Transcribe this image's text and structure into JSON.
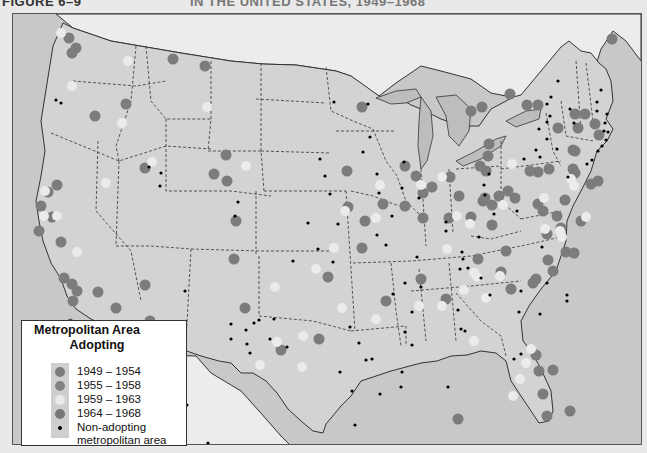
{
  "header": {
    "figure_label": "FIGURE 6–9",
    "title": "IN THE UNITED STATES, 1949–1968"
  },
  "colors": {
    "land": "#d3d3d3",
    "water": "#c6c6c6",
    "foreign": "#ececec",
    "dot_1949_1954": "#7c7c7c",
    "dot_1955_1958": "#828282",
    "dot_1959_1963": "#ebebeb",
    "dot_1964_1968": "#767676",
    "non_adopting": "#000000"
  },
  "legend": {
    "title_line1": "Metropolitan Area",
    "title_line2": "Adopting",
    "items": [
      {
        "label": "1949  –  1954",
        "type": "1949_1954"
      },
      {
        "label": "1955  –  1958",
        "type": "1955_1958"
      },
      {
        "label": "1959  –  1963",
        "type": "1959_1963"
      },
      {
        "label": "1964  –  1968",
        "type": "1964_1968"
      },
      {
        "label": "Non-adopting",
        "label2": "metropolitan area",
        "type": "non"
      }
    ]
  },
  "cities_adopting": [
    [
      68,
      37
    ],
    [
      75,
      47
    ],
    [
      71,
      52
    ],
    [
      172,
      58
    ],
    [
      204,
      65
    ],
    [
      94,
      115
    ],
    [
      125,
      103
    ],
    [
      144,
      167
    ],
    [
      225,
      154
    ],
    [
      213,
      173
    ],
    [
      226,
      180
    ],
    [
      56,
      184
    ],
    [
      47,
      191
    ],
    [
      40,
      205
    ],
    [
      51,
      216
    ],
    [
      38,
      230
    ],
    [
      60,
      241
    ],
    [
      63,
      277
    ],
    [
      71,
      283
    ],
    [
      76,
      290
    ],
    [
      72,
      300
    ],
    [
      115,
      307
    ],
    [
      97,
      291
    ],
    [
      144,
      284
    ],
    [
      149,
      320
    ],
    [
      160,
      333
    ],
    [
      235,
      220
    ],
    [
      233,
      258
    ],
    [
      244,
      307
    ],
    [
      280,
      349
    ],
    [
      318,
      338
    ],
    [
      327,
      276
    ],
    [
      361,
      247
    ],
    [
      347,
      206
    ],
    [
      364,
      220
    ],
    [
      382,
      203
    ],
    [
      385,
      300
    ],
    [
      420,
      278
    ],
    [
      445,
      298
    ],
    [
      457,
      418
    ],
    [
      361,
      106
    ],
    [
      346,
      170
    ],
    [
      404,
      165
    ],
    [
      415,
      175
    ],
    [
      422,
      192
    ],
    [
      404,
      205
    ],
    [
      422,
      217
    ],
    [
      458,
      195
    ],
    [
      485,
      170
    ],
    [
      487,
      155
    ],
    [
      479,
      165
    ],
    [
      449,
      176
    ],
    [
      431,
      186
    ],
    [
      448,
      217
    ],
    [
      470,
      216
    ],
    [
      482,
      200
    ],
    [
      491,
      204
    ],
    [
      498,
      195
    ],
    [
      507,
      190
    ],
    [
      514,
      197
    ],
    [
      484,
      197
    ],
    [
      537,
      203
    ],
    [
      537,
      171
    ],
    [
      529,
      170
    ],
    [
      548,
      168
    ],
    [
      572,
      149
    ],
    [
      572,
      168
    ],
    [
      564,
      199
    ],
    [
      556,
      215
    ],
    [
      470,
      110
    ],
    [
      488,
      143
    ],
    [
      481,
      106
    ],
    [
      509,
      93
    ],
    [
      526,
      104
    ],
    [
      537,
      104
    ],
    [
      557,
      127
    ],
    [
      574,
      113
    ],
    [
      584,
      113
    ],
    [
      574,
      150
    ],
    [
      577,
      127
    ],
    [
      594,
      123
    ],
    [
      598,
      134
    ],
    [
      574,
      172
    ],
    [
      590,
      183
    ],
    [
      597,
      180
    ],
    [
      580,
      220
    ],
    [
      560,
      227
    ],
    [
      542,
      210
    ],
    [
      546,
      233
    ],
    [
      491,
      224
    ],
    [
      477,
      258
    ],
    [
      565,
      251
    ],
    [
      573,
      252
    ],
    [
      547,
      259
    ],
    [
      500,
      271
    ],
    [
      552,
      270
    ],
    [
      535,
      278
    ],
    [
      532,
      282
    ],
    [
      510,
      288
    ],
    [
      535,
      354
    ],
    [
      538,
      370
    ],
    [
      552,
      369
    ],
    [
      542,
      393
    ],
    [
      569,
      410
    ],
    [
      546,
      415
    ],
    [
      505,
      250
    ],
    [
      611,
      38
    ]
  ],
  "cities_light": [
    [
      60,
      32
    ],
    [
      127,
      60
    ],
    [
      206,
      106
    ],
    [
      71,
      85
    ],
    [
      44,
      190
    ],
    [
      43,
      215
    ],
    [
      56,
      215
    ],
    [
      76,
      251
    ],
    [
      105,
      182
    ],
    [
      121,
      122
    ],
    [
      151,
      161
    ],
    [
      245,
      165
    ],
    [
      333,
      247
    ],
    [
      315,
      268
    ],
    [
      379,
      184
    ],
    [
      375,
      217
    ],
    [
      344,
      210
    ],
    [
      420,
      184
    ],
    [
      441,
      176
    ],
    [
      456,
      215
    ],
    [
      469,
      223
    ],
    [
      502,
      204
    ],
    [
      511,
      163
    ],
    [
      544,
      228
    ],
    [
      559,
      230
    ],
    [
      561,
      236
    ],
    [
      585,
      216
    ],
    [
      570,
      178
    ],
    [
      573,
      185
    ],
    [
      543,
      197
    ],
    [
      499,
      275
    ],
    [
      473,
      272
    ],
    [
      446,
      248
    ],
    [
      463,
      289
    ],
    [
      476,
      276
    ],
    [
      485,
      297
    ],
    [
      530,
      348
    ],
    [
      519,
      378
    ],
    [
      512,
      395
    ],
    [
      525,
      362
    ],
    [
      302,
      335
    ],
    [
      276,
      341
    ],
    [
      259,
      364
    ],
    [
      274,
      286
    ],
    [
      301,
      366
    ],
    [
      418,
      305
    ],
    [
      341,
      307
    ],
    [
      441,
      305
    ],
    [
      473,
      340
    ],
    [
      375,
      318
    ]
  ],
  "cities_non": [
    [
      60,
      102
    ],
    [
      160,
      172
    ],
    [
      159,
      185
    ],
    [
      237,
      201
    ],
    [
      234,
      215
    ],
    [
      324,
      175
    ],
    [
      319,
      158
    ],
    [
      329,
      193
    ],
    [
      367,
      103
    ],
    [
      333,
      101
    ],
    [
      369,
      136
    ],
    [
      362,
      151
    ],
    [
      376,
      173
    ],
    [
      378,
      192
    ],
    [
      337,
      223
    ],
    [
      307,
      222
    ],
    [
      292,
      260
    ],
    [
      317,
      248
    ],
    [
      332,
      261
    ],
    [
      376,
      234
    ],
    [
      385,
      244
    ],
    [
      401,
      187
    ],
    [
      403,
      161
    ],
    [
      418,
      197
    ],
    [
      445,
      221
    ],
    [
      445,
      230
    ],
    [
      462,
      258
    ],
    [
      467,
      267
    ],
    [
      480,
      277
    ],
    [
      488,
      173
    ],
    [
      483,
      184
    ],
    [
      484,
      194
    ],
    [
      493,
      213
    ],
    [
      516,
      210
    ],
    [
      523,
      158
    ],
    [
      535,
      149
    ],
    [
      538,
      128
    ],
    [
      546,
      121
    ],
    [
      549,
      115
    ],
    [
      546,
      103
    ],
    [
      546,
      138
    ],
    [
      556,
      148
    ],
    [
      567,
      176
    ],
    [
      586,
      163
    ],
    [
      591,
      159
    ],
    [
      597,
      150
    ],
    [
      601,
      145
    ],
    [
      605,
      139
    ],
    [
      603,
      130
    ],
    [
      607,
      131
    ],
    [
      604,
      122
    ],
    [
      606,
      113
    ],
    [
      573,
      122
    ],
    [
      569,
      108
    ],
    [
      550,
      96
    ],
    [
      557,
      80
    ],
    [
      596,
      101
    ],
    [
      596,
      110
    ],
    [
      600,
      89
    ],
    [
      539,
      156
    ],
    [
      541,
      246
    ],
    [
      546,
      282
    ],
    [
      520,
      290
    ],
    [
      566,
      294
    ],
    [
      539,
      313
    ],
    [
      566,
      300
    ],
    [
      245,
      329
    ],
    [
      246,
      343
    ],
    [
      249,
      352
    ],
    [
      258,
      319
    ],
    [
      230,
      323
    ],
    [
      230,
      338
    ],
    [
      253,
      322
    ],
    [
      269,
      338
    ],
    [
      273,
      318
    ],
    [
      286,
      346
    ],
    [
      371,
      358
    ],
    [
      339,
      371
    ],
    [
      351,
      390
    ],
    [
      365,
      359
    ],
    [
      349,
      326
    ],
    [
      404,
      331
    ],
    [
      411,
      344
    ],
    [
      401,
      371
    ],
    [
      447,
      386
    ],
    [
      461,
      251
    ],
    [
      478,
      236
    ],
    [
      459,
      268
    ],
    [
      416,
      256
    ],
    [
      358,
      342
    ],
    [
      404,
      282
    ],
    [
      392,
      293
    ],
    [
      411,
      311
    ],
    [
      379,
      393
    ],
    [
      354,
      424
    ],
    [
      400,
      386
    ],
    [
      457,
      309
    ],
    [
      464,
      330
    ],
    [
      460,
      328
    ],
    [
      513,
      358
    ],
    [
      520,
      353
    ],
    [
      184,
      290
    ],
    [
      186,
      404
    ],
    [
      207,
      442
    ],
    [
      148,
      166
    ],
    [
      55,
      99
    ],
    [
      420,
      286
    ],
    [
      518,
      311
    ],
    [
      391,
      215
    ],
    [
      489,
      294
    ]
  ]
}
